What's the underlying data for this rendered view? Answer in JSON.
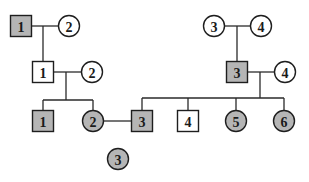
{
  "colors": {
    "affected_fill": "#b5b5b5",
    "unaffected_fill": "#ffffff",
    "stroke": "#1e1e1e",
    "background": "#ffffff"
  },
  "legend_note": "Shaded = affected; square = male; circle = female",
  "generations": [
    {
      "id": "I",
      "individuals": [
        {
          "key": "I-1",
          "label": "1",
          "sex": "male",
          "affected": true,
          "x": 21,
          "y": 26
        },
        {
          "key": "I-2",
          "label": "2",
          "sex": "female",
          "affected": false,
          "x": 69,
          "y": 26
        },
        {
          "key": "I-3",
          "label": "3",
          "sex": "female",
          "affected": false,
          "x": 214,
          "y": 26
        },
        {
          "key": "I-4",
          "label": "4",
          "sex": "female",
          "affected": false,
          "x": 261,
          "y": 26
        }
      ]
    },
    {
      "id": "II",
      "individuals": [
        {
          "key": "II-1",
          "label": "1",
          "sex": "male",
          "affected": false,
          "x": 43,
          "y": 72
        },
        {
          "key": "II-2",
          "label": "2",
          "sex": "female",
          "affected": false,
          "x": 92,
          "y": 72
        },
        {
          "key": "II-3",
          "label": "3",
          "sex": "male",
          "affected": true,
          "x": 237,
          "y": 72
        },
        {
          "key": "II-4",
          "label": "4",
          "sex": "female",
          "affected": false,
          "x": 285,
          "y": 72
        }
      ]
    },
    {
      "id": "III",
      "individuals": [
        {
          "key": "III-1",
          "label": "1",
          "sex": "male",
          "affected": true,
          "x": 43,
          "y": 121
        },
        {
          "key": "III-2",
          "label": "2",
          "sex": "female",
          "affected": true,
          "x": 93,
          "y": 121
        },
        {
          "key": "III-3",
          "label": "3",
          "sex": "male",
          "affected": true,
          "x": 142,
          "y": 121
        },
        {
          "key": "III-4",
          "label": "4",
          "sex": "male",
          "affected": false,
          "x": 188,
          "y": 121
        },
        {
          "key": "III-5",
          "label": "5",
          "sex": "female",
          "affected": true,
          "x": 236,
          "y": 121
        },
        {
          "key": "III-6",
          "label": "6",
          "sex": "female",
          "affected": true,
          "x": 284,
          "y": 121
        }
      ]
    },
    {
      "id": "IV",
      "individuals": [
        {
          "key": "IV-3",
          "label": "3",
          "sex": "female",
          "affected": true,
          "x": 118,
          "y": 159
        }
      ]
    }
  ],
  "lines": [
    {
      "name": "mating-I1-I2",
      "x1": 31,
      "y1": 26,
      "x2": 59,
      "y2": 26
    },
    {
      "name": "descent-I1-I2",
      "x1": 43,
      "y1": 26,
      "x2": 43,
      "y2": 62
    },
    {
      "name": "mating-I3-I4",
      "x1": 224,
      "y1": 26,
      "x2": 251,
      "y2": 26
    },
    {
      "name": "descent-I3-I4",
      "x1": 237,
      "y1": 26,
      "x2": 237,
      "y2": 62
    },
    {
      "name": "mating-II1-II2",
      "x1": 53,
      "y1": 72,
      "x2": 82,
      "y2": 72
    },
    {
      "name": "descent-II1-II2",
      "x1": 66,
      "y1": 72,
      "x2": 66,
      "y2": 100
    },
    {
      "name": "sibship-II1-II2",
      "x1": 43,
      "y1": 100,
      "x2": 93,
      "y2": 100
    },
    {
      "name": "drop-III1",
      "x1": 43,
      "y1": 100,
      "x2": 43,
      "y2": 111
    },
    {
      "name": "drop-III2",
      "x1": 93,
      "y1": 100,
      "x2": 93,
      "y2": 111
    },
    {
      "name": "mating-II3-II4",
      "x1": 247,
      "y1": 72,
      "x2": 275,
      "y2": 72
    },
    {
      "name": "descent-II3-II4",
      "x1": 260,
      "y1": 72,
      "x2": 260,
      "y2": 98
    },
    {
      "name": "sibship-II3-II4",
      "x1": 142,
      "y1": 98,
      "x2": 284,
      "y2": 98
    },
    {
      "name": "drop-III3",
      "x1": 142,
      "y1": 98,
      "x2": 142,
      "y2": 111
    },
    {
      "name": "drop-III4",
      "x1": 188,
      "y1": 98,
      "x2": 188,
      "y2": 111
    },
    {
      "name": "drop-III5",
      "x1": 236,
      "y1": 98,
      "x2": 236,
      "y2": 111
    },
    {
      "name": "drop-III6",
      "x1": 284,
      "y1": 98,
      "x2": 284,
      "y2": 111
    },
    {
      "name": "mating-III2-III3",
      "x1": 103,
      "y1": 121,
      "x2": 132,
      "y2": 121
    }
  ]
}
